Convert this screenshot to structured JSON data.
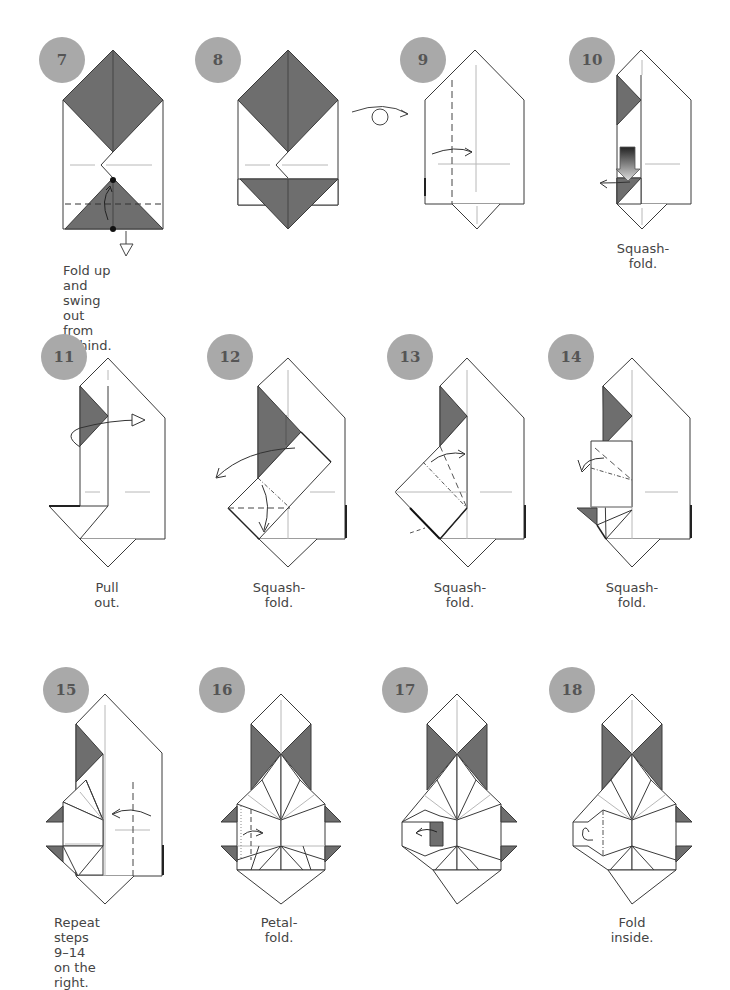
{
  "colors": {
    "badge": "#a9a9a9",
    "badge_text": "#555555",
    "paper_colored": "#6e6e6e",
    "paper_white": "#ffffff",
    "outline": "#3a3a3a",
    "crease": "#b8b8b8"
  },
  "steps": [
    {
      "number": "7",
      "caption": "Fold up and swing\nout from behind."
    },
    {
      "number": "8",
      "caption": ""
    },
    {
      "number": "9",
      "caption": "",
      "symbol": "turn-over-icon"
    },
    {
      "number": "10",
      "caption": "Squash-fold."
    },
    {
      "number": "11",
      "caption": "Pull out."
    },
    {
      "number": "12",
      "caption": "Squash-fold."
    },
    {
      "number": "13",
      "caption": "Squash-fold."
    },
    {
      "number": "14",
      "caption": "Squash-fold."
    },
    {
      "number": "15",
      "caption": "Repeat steps 9–14\non the right."
    },
    {
      "number": "16",
      "caption": "Petal-fold."
    },
    {
      "number": "17",
      "caption": ""
    },
    {
      "number": "18",
      "caption": "Fold inside."
    }
  ]
}
